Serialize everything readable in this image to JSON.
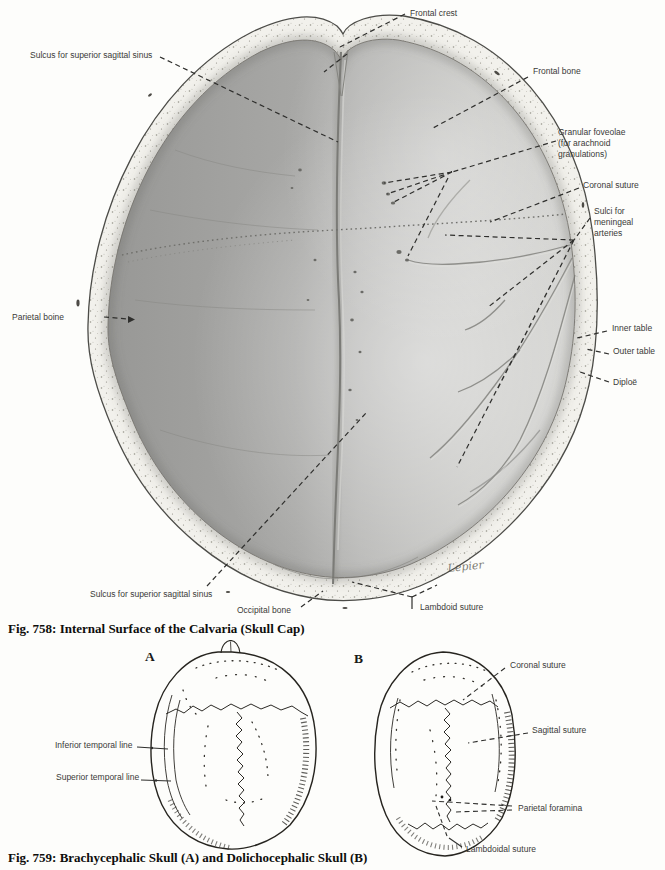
{
  "page": {
    "type": "anatomy-atlas-page",
    "colors": {
      "paper": "#fdfdfb",
      "label_ink": "#3a3a38",
      "caption_ink": "#0e0e0c",
      "calvaria_dark": "#9d9d9b",
      "calvaria_light": "#cfcfcc",
      "bone_rim": "#f2f1ec",
      "line_art_ink": "#26241f"
    }
  },
  "f758": {
    "caption": "Fig. 758: Internal Surface of the Calvaria (Skull Cap)",
    "labels": {
      "frontal_crest": "Frontal crest",
      "sulcus_sss_top": "Sulcus for superior sagittal sinus",
      "frontal_bone": "Frontal bone",
      "granular_l1": "Granular foveolae",
      "granular_l2": "(for arachnoid",
      "granular_l3": "granulations)",
      "coronal_suture": "Coronal suture",
      "sulci_l1": "Sulci for",
      "sulci_l2": "meningeal",
      "sulci_l3": "arteries",
      "parietal_bone": "Parietal boine",
      "inner_table": "Inner table",
      "outer_table": "Outer table",
      "diploe": "Diploë",
      "sulcus_sss_bottom": "Sulcus for superior sagittal sinus",
      "occipital_bone": "Occipital bone",
      "lambdoid_suture": "Lambdoid suture",
      "artist_signature": "Lepier"
    }
  },
  "f759": {
    "caption": "Fig. 759: Brachycephalic Skull (A) and Dolichocephalic Skull (B)",
    "skull_a": "A",
    "skull_b": "B",
    "labels": {
      "coronal_suture": "Coronal suture",
      "sagittal_suture": "Sagittal suture",
      "inferior_temporal_line": "Inferior temporal line",
      "superior_temporal_line": "Superior temporal line",
      "parietal_foramina": "Parietal foramina",
      "lambdoidal_suture": "Lambdoidal suture"
    }
  }
}
